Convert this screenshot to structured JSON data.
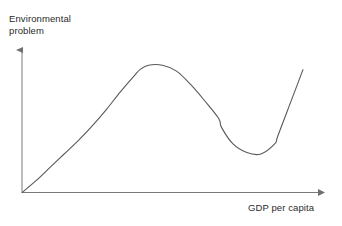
{
  "figure": {
    "background_color": "#ffffff",
    "line_color": "#595959",
    "axis_color": "#7a7a7a",
    "text_color": "#2b2b2b"
  },
  "axes": {
    "y_label_line1": "Environmental",
    "y_label_line2": "problem",
    "y_label": "Environmental problem",
    "x_label": "GDP per capita"
  },
  "chart_data": {
    "type": "line",
    "title": "",
    "subtitle": "",
    "xlabel": "GDP per capita",
    "ylabel": "Environmental problem",
    "grid": false,
    "legend": null,
    "legend_position": "none",
    "axis_arrows": true,
    "tick_labels_x": [],
    "tick_labels_y": [],
    "xlim": [
      0,
      100
    ],
    "ylim": [
      0,
      100
    ],
    "series": [
      {
        "name": "Environmental Kuznets curve with rebound",
        "color": "#595959",
        "x": [
          0,
          5,
          10,
          15,
          20,
          25,
          30,
          35,
          40,
          42,
          45,
          50,
          55,
          60,
          65,
          70,
          71,
          75,
          80,
          85,
          90,
          91,
          95,
          100
        ],
        "y": [
          0,
          8,
          17,
          26,
          35,
          45,
          56,
          68,
          79,
          83,
          86,
          86,
          82,
          73,
          62,
          50,
          44,
          33,
          27,
          26,
          33,
          38,
          58,
          83
        ]
      }
    ],
    "annotations": [
      {
        "name": "origin",
        "x": 0,
        "y": 0
      },
      {
        "name": "peak",
        "x": 46,
        "y": 86
      },
      {
        "name": "trough",
        "x": 85,
        "y": 26
      },
      {
        "name": "end",
        "x": 100,
        "y": 83
      }
    ]
  }
}
